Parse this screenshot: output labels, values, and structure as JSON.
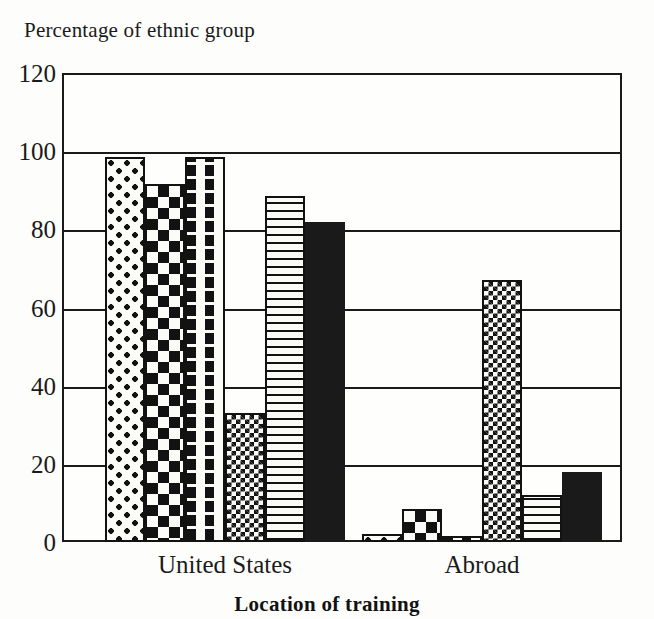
{
  "chart_data": {
    "type": "bar",
    "title": "Percentage of ethnic group",
    "xlabel": "Location of training",
    "ylabel": "",
    "categories": [
      "United States",
      "Abroad"
    ],
    "ylim": [
      0,
      120
    ],
    "yticks": [
      0,
      20,
      40,
      60,
      80,
      100,
      120
    ],
    "ytick_labels": [
      "0",
      "20",
      "40",
      "60",
      "80",
      "100",
      "120"
    ],
    "grid": true,
    "legend": "none",
    "series": [
      {
        "name": "group-1",
        "pattern": "large-dots",
        "values": [
          98.5,
          2.0
        ]
      },
      {
        "name": "group-2",
        "pattern": "checkerboard",
        "values": [
          91.5,
          8.5
        ]
      },
      {
        "name": "group-3",
        "pattern": "dashes",
        "values": [
          98.5,
          1.5
        ]
      },
      {
        "name": "group-4",
        "pattern": "fine-checkerboard",
        "values": [
          33.0,
          67.0
        ]
      },
      {
        "name": "group-5",
        "pattern": "horizontal-lines",
        "values": [
          88.5,
          12.0
        ]
      },
      {
        "name": "group-6",
        "pattern": "solid-black",
        "values": [
          82.0,
          18.0
        ]
      }
    ]
  }
}
